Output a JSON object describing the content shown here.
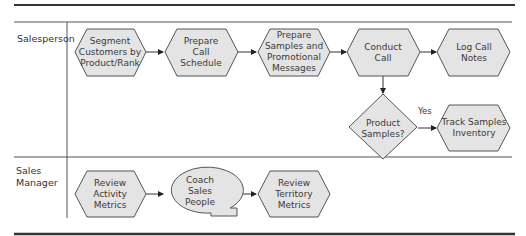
{
  "diagram": {
    "type": "swimlane-process-flow",
    "lanes": [
      {
        "id": "salesperson",
        "label_lines": [
          "Salesperson"
        ]
      },
      {
        "id": "sales-manager",
        "label_lines": [
          "Sales",
          "Manager"
        ]
      }
    ],
    "nodes": [
      {
        "id": "segment",
        "lane": "salesperson",
        "shape": "hexagon",
        "lines": [
          "Segment",
          "Customers by",
          "Product/Rank"
        ]
      },
      {
        "id": "schedule",
        "lane": "salesperson",
        "shape": "hexagon",
        "lines": [
          "Prepare",
          "Call",
          "Schedule"
        ]
      },
      {
        "id": "samples",
        "lane": "salesperson",
        "shape": "hexagon",
        "lines": [
          "Prepare",
          "Samples and",
          "Promotional",
          "Messages"
        ]
      },
      {
        "id": "conduct",
        "lane": "salesperson",
        "shape": "hexagon",
        "lines": [
          "Conduct",
          "Call"
        ]
      },
      {
        "id": "log",
        "lane": "salesperson",
        "shape": "hexagon",
        "lines": [
          "Log Call",
          "Notes"
        ]
      },
      {
        "id": "decision",
        "lane": "salesperson",
        "shape": "diamond",
        "lines": [
          "Product",
          "Samples?"
        ]
      },
      {
        "id": "track",
        "lane": "salesperson",
        "shape": "hexagon",
        "lines": [
          "Track Samples",
          "Inventory"
        ]
      },
      {
        "id": "review-activity",
        "lane": "sales-manager",
        "shape": "hexagon",
        "lines": [
          "Review",
          "Activity",
          "Metrics"
        ]
      },
      {
        "id": "coach",
        "lane": "sales-manager",
        "shape": "callout-oval",
        "lines": [
          "Coach",
          "Sales",
          "People"
        ]
      },
      {
        "id": "review-territory",
        "lane": "sales-manager",
        "shape": "hexagon",
        "lines": [
          "Review",
          "Territory",
          "Metrics"
        ]
      }
    ],
    "edges": [
      {
        "from": "segment",
        "to": "schedule",
        "label": ""
      },
      {
        "from": "schedule",
        "to": "samples",
        "label": ""
      },
      {
        "from": "samples",
        "to": "conduct",
        "label": ""
      },
      {
        "from": "conduct",
        "to": "log",
        "label": ""
      },
      {
        "from": "conduct",
        "to": "decision",
        "label": ""
      },
      {
        "from": "decision",
        "to": "track",
        "label": "Yes"
      },
      {
        "from": "review-activity",
        "to": "coach",
        "label": ""
      },
      {
        "from": "coach",
        "to": "review-territory",
        "label": ""
      }
    ],
    "colors": {
      "node_fill": "#e4e4e4",
      "node_stroke": "#555555",
      "line": "#333333",
      "text": "#3a3a3a"
    }
  }
}
